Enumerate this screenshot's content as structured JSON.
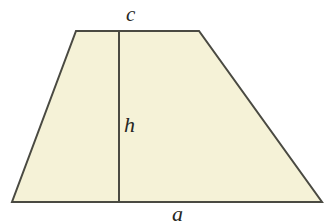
{
  "figure": {
    "name": "trapezoid-with-height",
    "shape_type": "trapezoid",
    "background_color": "#ffffff",
    "fill_color": "#f5f2d7",
    "stroke_color": "#4a4a42",
    "stroke_width": 2,
    "vertices": {
      "top_left": [
        76,
        31
      ],
      "top_right": [
        199,
        31
      ],
      "bottom_right": [
        322,
        202
      ],
      "bottom_left": [
        12,
        202
      ]
    },
    "height_line": {
      "name": "height-segment",
      "x": 119,
      "y_top": 31,
      "y_bottom": 202
    },
    "labels": {
      "top_side": "c",
      "height": "h",
      "bottom_side": "a"
    }
  }
}
